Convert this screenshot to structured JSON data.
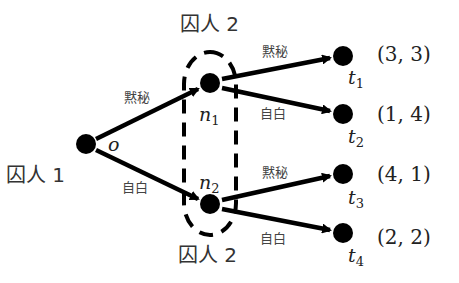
{
  "diagram": {
    "type": "extensive-form game tree",
    "colors": {
      "ink": "#000000",
      "text": "#222222",
      "background": "#ffffff"
    },
    "players": {
      "player1_label": "囚人 1",
      "player2_top_label": "囚人 2",
      "player2_bottom_label": "囚人 2"
    },
    "nodes": {
      "root": {
        "name": "o"
      },
      "n1": {
        "name": "n",
        "sub": "1"
      },
      "n2": {
        "name": "n",
        "sub": "2"
      },
      "t1": {
        "name": "t",
        "sub": "1",
        "payoff": "(3, 3)"
      },
      "t2": {
        "name": "t",
        "sub": "2",
        "payoff": "(1, 4)"
      },
      "t3": {
        "name": "t",
        "sub": "3",
        "payoff": "(4, 1)"
      },
      "t4": {
        "name": "t",
        "sub": "4",
        "payoff": "(2, 2)"
      }
    },
    "actions": {
      "o_n1": "黙秘",
      "o_n2": "自白",
      "n1_t1": "黙秘",
      "n1_t2": "自白",
      "n2_t3": "黙秘",
      "n2_t4": "自白"
    },
    "information_set": "n1, n2 (dashed)"
  }
}
